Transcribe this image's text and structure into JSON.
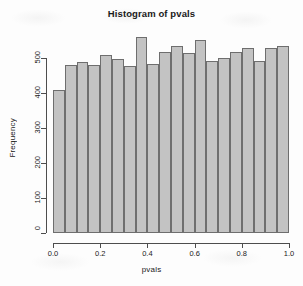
{
  "chart_data": {
    "type": "bar",
    "title": "Histogram of pvals",
    "xlabel": "pvals",
    "ylabel": "Frequency",
    "xlim": [
      0.0,
      1.0
    ],
    "ylim": [
      0,
      560
    ],
    "grid": false,
    "legend": null,
    "bin_width": 0.05,
    "bin_starts": [
      0.0,
      0.05,
      0.1,
      0.15,
      0.2,
      0.25,
      0.3,
      0.35,
      0.4,
      0.45,
      0.5,
      0.55,
      0.6,
      0.65,
      0.7,
      0.75,
      0.8,
      0.85,
      0.9,
      0.95
    ],
    "categories": [
      "0.00-0.05",
      "0.05-0.10",
      "0.10-0.15",
      "0.15-0.20",
      "0.20-0.25",
      "0.25-0.30",
      "0.30-0.35",
      "0.35-0.40",
      "0.40-0.45",
      "0.45-0.50",
      "0.50-0.55",
      "0.55-0.60",
      "0.60-0.65",
      "0.65-0.70",
      "0.70-0.75",
      "0.75-0.80",
      "0.80-0.85",
      "0.85-0.90",
      "0.90-0.95",
      "0.95-1.00"
    ],
    "values": [
      410,
      481,
      489,
      480,
      509,
      497,
      478,
      560,
      484,
      516,
      535,
      515,
      551,
      492,
      499,
      517,
      528,
      492,
      528,
      534
    ],
    "xticks": [
      0.0,
      0.2,
      0.4,
      0.6,
      0.8,
      1.0
    ],
    "xtick_labels": [
      "0.0",
      "0.2",
      "0.4",
      "0.6",
      "0.8",
      "1.0"
    ],
    "yticks": [
      0,
      100,
      200,
      300,
      400,
      500
    ],
    "ytick_labels": [
      "0",
      "100",
      "200",
      "300",
      "400",
      "500"
    ],
    "bar_fill_color": "#c3c3c3",
    "bar_border_color": "#6e6e6e",
    "axis_color": "#4d4d4d",
    "background_color": "#ffffff"
  }
}
